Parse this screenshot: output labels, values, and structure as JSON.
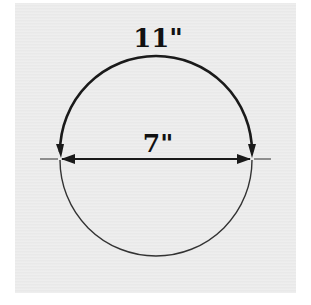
{
  "diagram": {
    "arc_label": "11\"",
    "diameter_label": "7\"",
    "colors": {
      "stroke": "#1a1a1a",
      "background": "#ececec"
    }
  }
}
